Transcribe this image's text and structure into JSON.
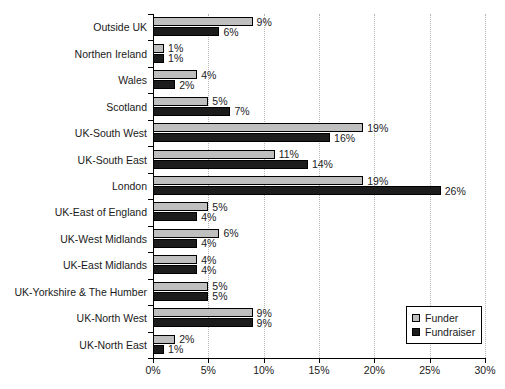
{
  "chart_data": {
    "type": "bar",
    "orientation": "horizontal",
    "title": "",
    "xlabel": "",
    "ylabel": "",
    "xlim": [
      0,
      30
    ],
    "xticks": [
      "0%",
      "5%",
      "10%",
      "15%",
      "20%",
      "25%",
      "30%"
    ],
    "xtick_values": [
      0,
      5,
      10,
      15,
      20,
      25,
      30
    ],
    "grid": "vertical-dotted",
    "legend_position": "bottom-right",
    "value_suffix": "%",
    "categories": [
      "Outside UK",
      "Northen Ireland",
      "Wales",
      "Scotland",
      "UK-South West",
      "UK-South East",
      "London",
      "UK-East of England",
      "UK-West Midlands",
      "UK-East Midlands",
      "UK-Yorkshire & The Humber",
      "UK-North West",
      "UK-North East"
    ],
    "series": [
      {
        "name": "Funder",
        "color": "#bfbfbf",
        "values": [
          9,
          1,
          4,
          5,
          19,
          11,
          19,
          5,
          6,
          4,
          5,
          9,
          2
        ],
        "labels": [
          "9%",
          "1%",
          "4%",
          "5%",
          "19%",
          "11%",
          "19%",
          "5%",
          "6%",
          "4%",
          "5%",
          "9%",
          "2%"
        ]
      },
      {
        "name": "Fundraiser",
        "color": "#1c1c1c",
        "values": [
          6,
          1,
          2,
          7,
          16,
          14,
          26,
          4,
          4,
          4,
          5,
          9,
          1
        ],
        "labels": [
          "6%",
          "1%",
          "2%",
          "7%",
          "16%",
          "14%",
          "26%",
          "4%",
          "4%",
          "4%",
          "5%",
          "9%",
          "1%"
        ]
      }
    ]
  },
  "legend": {
    "items": [
      {
        "label": "Funder",
        "swatch": "funder"
      },
      {
        "label": "Fundraiser",
        "swatch": "fundraiser"
      }
    ]
  }
}
